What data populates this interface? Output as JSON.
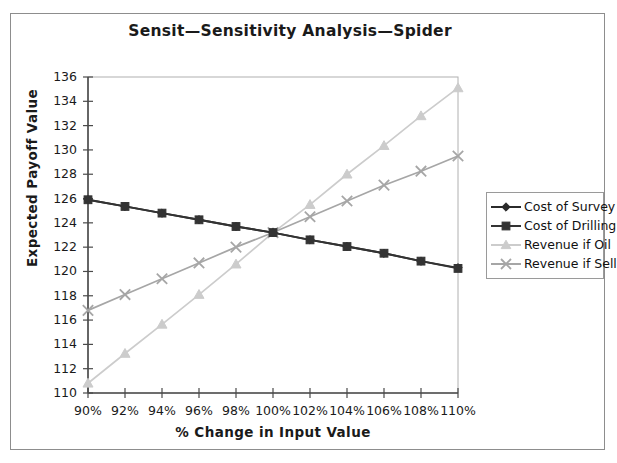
{
  "chart_data": {
    "type": "line",
    "title": "Sensit—Sensitivity Analysis—Spider",
    "xlabel": "% Change in Input Value",
    "ylabel": "Expected Payoff Value",
    "categories": [
      "90%",
      "92%",
      "94%",
      "96%",
      "98%",
      "100%",
      "102%",
      "104%",
      "106%",
      "108%",
      "110%"
    ],
    "x": [
      90,
      92,
      94,
      96,
      98,
      100,
      102,
      104,
      106,
      108,
      110
    ],
    "xlim": [
      90,
      110
    ],
    "ylim": [
      110,
      136
    ],
    "yticks": [
      110,
      112,
      114,
      116,
      118,
      120,
      122,
      124,
      126,
      128,
      130,
      132,
      134,
      136
    ],
    "grid": false,
    "legend_position": "right",
    "series": [
      {
        "name": "Cost of Survey",
        "marker": "diamond",
        "color": "#2b2b2b",
        "values": [
          125.9,
          125.35,
          124.8,
          124.25,
          123.7,
          123.2,
          122.6,
          122.05,
          121.5,
          120.85,
          120.3
        ]
      },
      {
        "name": "Cost of Drilling",
        "marker": "square",
        "color": "#333333",
        "values": [
          125.9,
          125.35,
          124.8,
          124.25,
          123.7,
          123.2,
          122.6,
          122.05,
          121.5,
          120.85,
          120.25
        ]
      },
      {
        "name": "Revenue if Oil",
        "marker": "triangle",
        "color": "#cccccc",
        "values": [
          110.8,
          113.25,
          115.65,
          118.1,
          120.6,
          123.2,
          125.5,
          128.0,
          130.35,
          132.8,
          135.1
        ]
      },
      {
        "name": "Revenue if Sell",
        "marker": "cross",
        "color": "#a6a6a6",
        "values": [
          116.8,
          118.1,
          119.4,
          120.7,
          122.0,
          123.2,
          124.5,
          125.8,
          127.1,
          128.25,
          129.5
        ]
      }
    ]
  },
  "colors": {
    "frame": "#8d8d8d",
    "axis": "#4a4a4a",
    "text": "#1a1a1a",
    "background": "#ffffff"
  }
}
